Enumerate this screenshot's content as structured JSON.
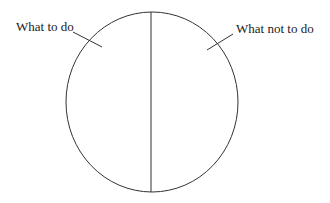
{
  "diagram": {
    "type": "divided-circle",
    "labels": {
      "left": "What to do",
      "right": "What not to do"
    },
    "colors": {
      "stroke": "#333333",
      "text": "#222222",
      "background": "#ffffff"
    }
  }
}
